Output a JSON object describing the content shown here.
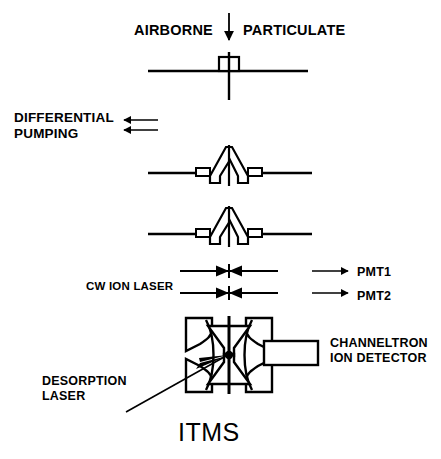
{
  "figure": {
    "title": "ITMS",
    "caption_label": "ITMS"
  },
  "labels": {
    "airborne": "AIRBORNE",
    "particulate": "PARTICULATE",
    "differential_pumping": "DIFFERENTIAL\nPUMPING",
    "cw_ion_laser": "CW ION LASER",
    "pmt1": "PMT1",
    "pmt2": "PMT2",
    "channeltron_ion_detector": "CHANNELTRON\nION DETECTOR",
    "desorption_laser": "DESORPTION\nLASER",
    "itms": "ITMS"
  },
  "components": {
    "inlet_nozzle": "inlet-nozzle-aperture",
    "stage_plates": [
      "inlet-plate",
      "skimmer-plate-1",
      "skimmer-plate-2"
    ],
    "skimmers": [
      "skimmer-cone-1",
      "skimmer-cone-2"
    ],
    "laser_beams": [
      "laser-beam-1",
      "laser-beam-2"
    ],
    "ion_trap": "quadrupole-ion-trap",
    "detector": "channeltron-detector-box",
    "focal_spot": "desorption-focal-spot"
  },
  "colors": {
    "stroke": "#000000",
    "background": "#ffffff",
    "fill": "#ffffff"
  },
  "geometry": {
    "width": 441,
    "height": 459,
    "beam_axis_x": 229,
    "stage_plate_y": [
      71,
      173,
      234
    ],
    "laser_beam_y": [
      271,
      293
    ],
    "trap_center_y": 355
  }
}
